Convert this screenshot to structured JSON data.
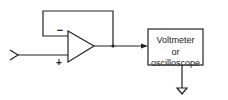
{
  "diagram": {
    "opamp": {
      "minus_label": "−",
      "plus_label": "+"
    },
    "box": {
      "line1": "Voltmeter",
      "line2": "or oscilloscope"
    },
    "colors": {
      "stroke": "#222222",
      "background": "#ffffff"
    }
  }
}
